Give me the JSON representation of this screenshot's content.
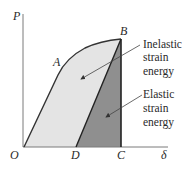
{
  "diagram": {
    "type": "load-deflection",
    "axes": {
      "y_label": "P",
      "x_label": "δ",
      "origin_label": "O"
    },
    "points": {
      "A": "A",
      "B": "B",
      "C": "C",
      "D": "D"
    },
    "annotations": {
      "inelastic": {
        "line1": "Inelastic",
        "line2": "strain",
        "line3": "energy"
      },
      "elastic": {
        "line1": "Elastic",
        "line2": "strain",
        "line3": "energy"
      }
    },
    "colors": {
      "inelastic_fill": "#e4e4e4",
      "elastic_fill": "#8f8f8f",
      "line": "#333333",
      "axis": "#7a7a7a"
    }
  }
}
